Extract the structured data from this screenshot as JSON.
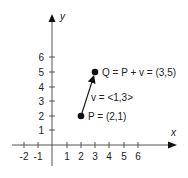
{
  "diagram": {
    "axes": {
      "x_label": "x",
      "y_label": "y",
      "x_ticks": [
        "-2",
        "-1",
        "1",
        "2",
        "3",
        "4",
        "5",
        "6"
      ],
      "y_ticks": [
        "1",
        "2",
        "3",
        "4",
        "5",
        "6"
      ]
    },
    "points": {
      "P": {
        "label": "P = (2,1)"
      },
      "Q": {
        "label": "Q = P + v = (3,5)"
      }
    },
    "vector": {
      "label": "v = <1,3>"
    },
    "colors": {
      "ink": "#222222",
      "axis": "#444444"
    }
  }
}
